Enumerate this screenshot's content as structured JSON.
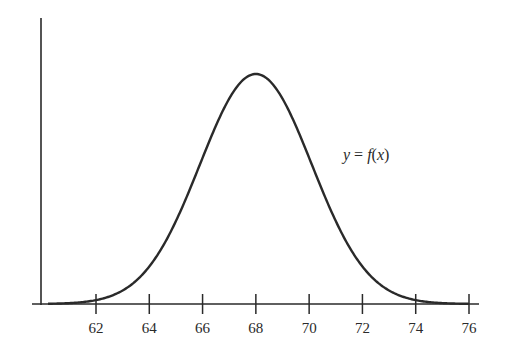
{
  "chart_data": {
    "type": "line",
    "title": "",
    "xlabel": "",
    "ylabel": "",
    "curve_label": "y = f(x)",
    "distribution": "normal",
    "mean": 68,
    "std_dev": 2.1,
    "x_ticks": [
      62,
      64,
      66,
      68,
      70,
      72,
      74,
      76
    ],
    "xlim": [
      60,
      76.5
    ],
    "y_ticks": [],
    "grid": false,
    "legend": "none",
    "series": [
      {
        "name": "y = f(x)",
        "x": [
          60,
          62,
          64,
          66,
          68,
          70,
          72,
          74,
          76
        ],
        "y_relative": [
          0.0007,
          0.017,
          0.163,
          0.635,
          1.0,
          0.635,
          0.163,
          0.017,
          0.0007
        ]
      }
    ]
  },
  "labels": {
    "func": "y = f(x)",
    "ticks": [
      "62",
      "64",
      "66",
      "68",
      "70",
      "72",
      "74",
      "76"
    ]
  },
  "colors": {
    "axis": "#2a2a2a",
    "curve": "#2a2a2a",
    "background": "#ffffff"
  }
}
